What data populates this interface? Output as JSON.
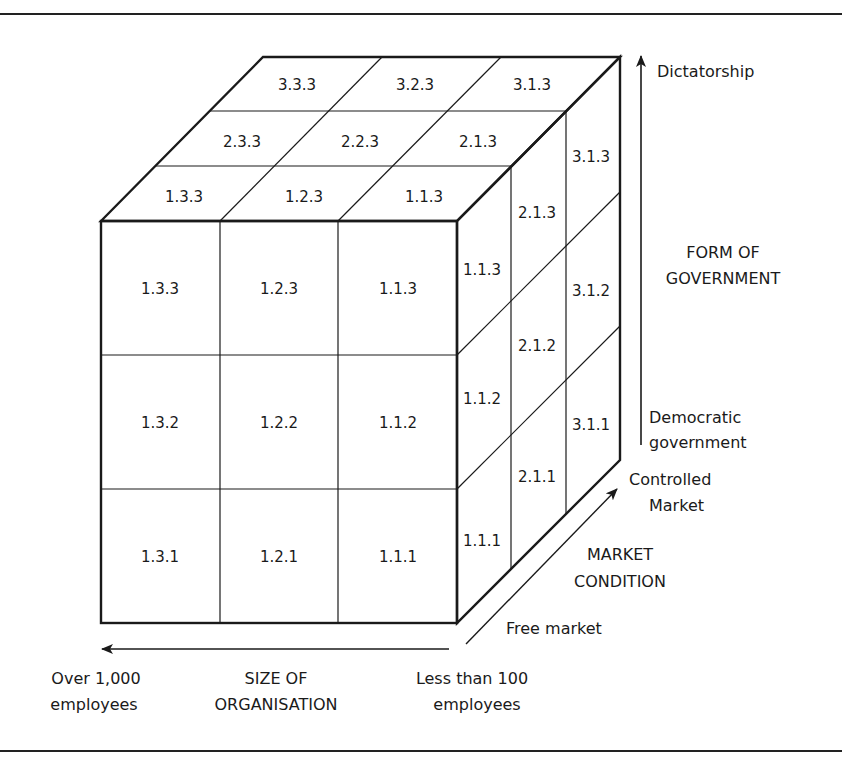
{
  "figure": {
    "type": "3d-cube-classification",
    "front_face": {
      "rows": [
        [
          "1.3.3",
          "1.2.3",
          "1.1.3"
        ],
        [
          "1.3.2",
          "1.2.2",
          "1.1.2"
        ],
        [
          "1.3.1",
          "1.2.1",
          "1.1.1"
        ]
      ]
    },
    "top_face": {
      "rows_back_to_front": [
        [
          "3.3.3",
          "3.2.3",
          "3.1.3"
        ],
        [
          "2.3.3",
          "2.2.3",
          "2.1.3"
        ],
        [
          "1.3.3",
          "1.2.3",
          "1.1.3"
        ]
      ]
    },
    "side_face": {
      "columns_front_to_back": [
        [
          "1.1.3",
          "1.1.2",
          "1.1.1"
        ],
        [
          "2.1.3",
          "2.1.2",
          "2.1.1"
        ],
        [
          "3.1.3",
          "3.1.2",
          "3.1.1"
        ]
      ]
    },
    "axes": {
      "vertical": {
        "title_line1": "FORM OF",
        "title_line2": "GOVERNMENT",
        "top_label": "Dictatorship",
        "bottom_label_line1": "Democratic",
        "bottom_label_line2": "government"
      },
      "depth": {
        "title_line1": "MARKET",
        "title_line2": "CONDITION",
        "far_label_line1": "Controlled",
        "far_label_line2": "Market",
        "near_label": "Free market"
      },
      "horizontal": {
        "title_line1": "SIZE OF",
        "title_line2": "ORGANISATION",
        "left_label_line1": "Over 1,000",
        "left_label_line2": "employees",
        "right_label_line1": "Less than 100",
        "right_label_line2": "employees"
      }
    }
  }
}
